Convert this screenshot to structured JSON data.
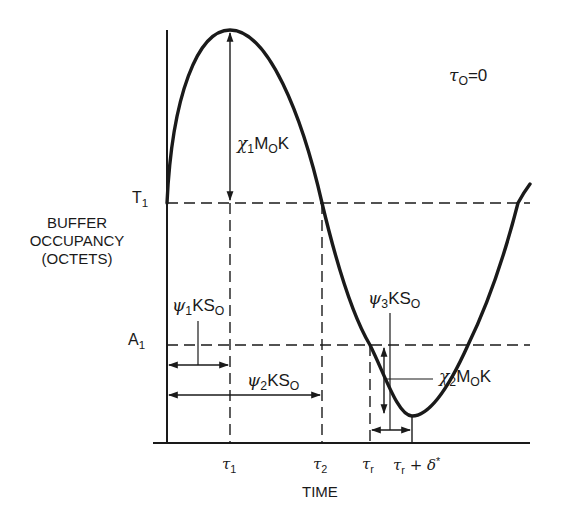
{
  "figure": {
    "y_axis_label": [
      "BUFFER",
      "OCCUPANCY",
      "(OCTETS)"
    ],
    "x_axis_label": "TIME",
    "initial_condition": {
      "symbol": "τ",
      "sub": "O",
      "rest": "=0"
    },
    "levels": {
      "T1": {
        "main": "T",
        "sub": "1"
      },
      "A1": {
        "main": "A",
        "sub": "1"
      }
    },
    "time_ticks": [
      {
        "id": "tau1",
        "main": "τ",
        "sub": "1",
        "rest": ""
      },
      {
        "id": "tau2",
        "main": "τ",
        "sub": "2",
        "rest": ""
      },
      {
        "id": "taur",
        "main": "τ",
        "sub": "r",
        "rest": ""
      },
      {
        "id": "taur_delta",
        "main": "τ",
        "sub": "r",
        "rest": " + δ",
        "sup": "*"
      }
    ],
    "annotations": {
      "chi1": {
        "greek": "χ",
        "sub1": "1",
        "text": "M",
        "sub2": "O",
        "tail": "K"
      },
      "chi2": {
        "greek": "χ",
        "sub1": "2",
        "text": "M",
        "sub2": "O",
        "tail": "K"
      },
      "psi1": {
        "greek": "ψ",
        "sub1": "1",
        "text": "KS",
        "sub2": "O"
      },
      "psi2": {
        "greek": "ψ",
        "sub1": "2",
        "text": "KS",
        "sub2": "O"
      },
      "psi3": {
        "greek": "ψ",
        "sub1": "3",
        "text": "KS",
        "sub2": "O"
      }
    },
    "colors": {
      "ink": "#1a1a1a",
      "background": "#ffffff"
    }
  }
}
